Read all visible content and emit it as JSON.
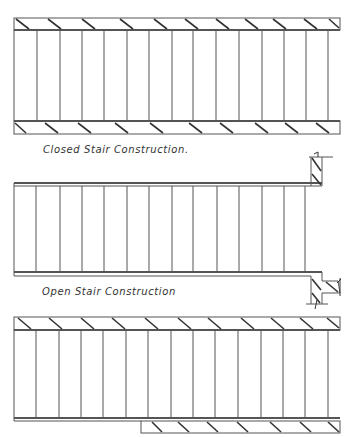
{
  "diagrams": [
    {
      "id": "closed",
      "label": "Closed Stair Construction.",
      "type": "closed-stair-plan",
      "risers": 15
    },
    {
      "id": "open",
      "label": "Open Stair Construction",
      "type": "open-stair-plan",
      "risers": 14
    },
    {
      "id": "semi",
      "label": "",
      "type": "closed-stair-plan-partial-bottom-stringer",
      "risers": 15
    }
  ],
  "colors": {
    "line": "#555555",
    "hatch": "#333333",
    "background": "#ffffff"
  }
}
